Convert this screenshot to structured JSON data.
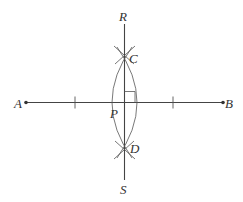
{
  "diagram": {
    "type": "perpendicular-bisector-construction",
    "colors": {
      "line": "#444444",
      "arc": "#555555",
      "label": "#333333",
      "background": "#ffffff"
    },
    "points": {
      "A": {
        "label": "A",
        "x": 26,
        "y": 102.5
      },
      "B": {
        "label": "B",
        "x": 223,
        "y": 102.5
      },
      "C": {
        "label": "C",
        "x": 124.5,
        "y": 56
      },
      "D": {
        "label": "D",
        "x": 124.5,
        "y": 149
      },
      "P": {
        "label": "P",
        "x": 124.5,
        "y": 102.5
      },
      "R": {
        "label": "R",
        "x": 124.5,
        "y": 24
      },
      "S": {
        "label": "S",
        "x": 124.5,
        "y": 180
      }
    },
    "segments": [
      {
        "name": "AB",
        "from": "A",
        "to": "B"
      },
      {
        "name": "RS",
        "from": "R",
        "to": "S"
      }
    ],
    "congruence_ticks": [
      75,
      173
    ],
    "right_angle_marker": {
      "at": "P",
      "size": 10.5
    },
    "arcs": [
      {
        "name": "left-arc",
        "from": "C",
        "to": "D",
        "bulge_x": 107
      },
      {
        "name": "right-arc",
        "from": "C",
        "to": "D",
        "bulge_x": 142
      }
    ]
  }
}
